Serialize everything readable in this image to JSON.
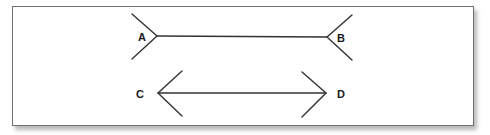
{
  "figure": {
    "line_color": "#333333",
    "border_color": "#6f6f6f",
    "background": "#ffffff",
    "lines": [
      {
        "id": "AB",
        "start_label": "A",
        "end_label": "B",
        "fin_style": "outward-fins",
        "start": [
          157,
          36
        ],
        "end": [
          327,
          37
        ]
      },
      {
        "id": "CD",
        "start_label": "C",
        "end_label": "D",
        "fin_style": "arrowheads",
        "start": [
          158,
          93
        ],
        "end": [
          326,
          93
        ]
      }
    ],
    "labels": {
      "a": "A",
      "b": "B",
      "c": "C",
      "d": "D"
    }
  }
}
